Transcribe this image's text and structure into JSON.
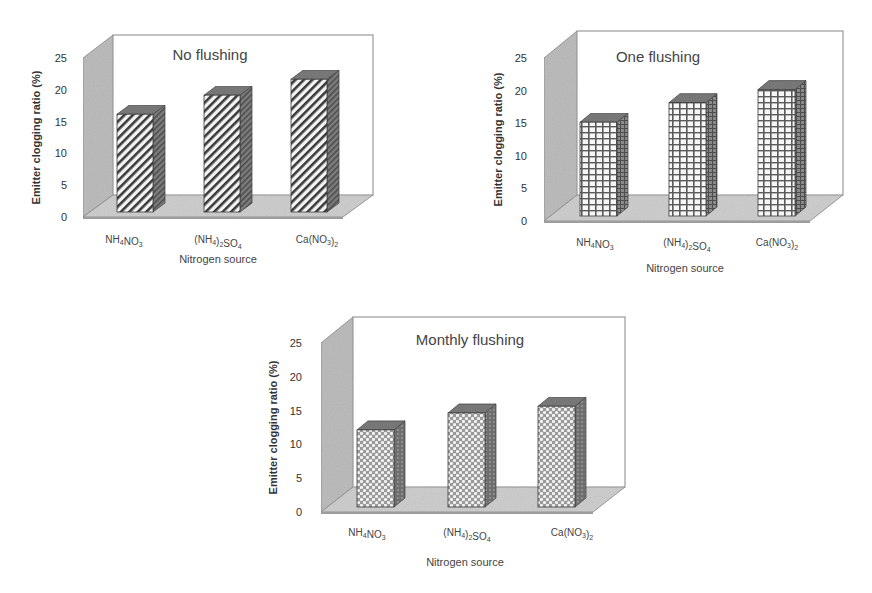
{
  "figure": {
    "charts": [
      {
        "title": "No flushing",
        "ylabel": "Emitter clogging ratio (%)",
        "xlabel": "Nitrogen source",
        "pattern": "diagonal",
        "yticks": [
          "0",
          "5",
          "10",
          "15",
          "20",
          "25"
        ],
        "categories": [
          {
            "base": "NH",
            "s1": "4",
            "mid": "NO",
            "s2": "3",
            "tail": ""
          },
          {
            "base": "(NH",
            "s1": "4",
            "mid": ")",
            "s2": "2",
            "tail": "SO",
            "s3": "4"
          },
          {
            "base": "Ca(NO",
            "s1": "3",
            "mid": ")",
            "s2": "2",
            "tail": ""
          }
        ]
      },
      {
        "title": "One flushing",
        "ylabel": "Emitter clogging ratio (%)",
        "xlabel": "Nitrogen source",
        "pattern": "grid",
        "yticks": [
          "0",
          "5",
          "10",
          "15",
          "20",
          "25"
        ],
        "categories": [
          {
            "base": "NH",
            "s1": "4",
            "mid": "NO",
            "s2": "3",
            "tail": ""
          },
          {
            "base": "(NH",
            "s1": "4",
            "mid": ")",
            "s2": "2",
            "tail": "SO",
            "s3": "4"
          },
          {
            "base": "Ca(NO",
            "s1": "3",
            "mid": ")",
            "s2": "2",
            "tail": ""
          }
        ]
      },
      {
        "title": "Monthly flushing",
        "ylabel": "Emitter clogging ratio (%)",
        "xlabel": "Nitrogen source",
        "pattern": "dots",
        "yticks": [
          "0",
          "5",
          "10",
          "15",
          "20",
          "25"
        ],
        "categories": [
          {
            "base": "NH",
            "s1": "4",
            "mid": "NO",
            "s2": "3",
            "tail": ""
          },
          {
            "base": "(NH",
            "s1": "4",
            "mid": ")",
            "s2": "2",
            "tail": "SO",
            "s3": "4"
          },
          {
            "base": "Ca(NO",
            "s1": "3",
            "mid": ")",
            "s2": "2",
            "tail": ""
          }
        ]
      }
    ]
  },
  "chart_data": [
    {
      "type": "bar",
      "title": "No flushing",
      "categories": [
        "NH4NO3",
        "(NH4)2SO4",
        "Ca(NO3)2"
      ],
      "values": [
        16,
        19,
        21.5
      ],
      "xlabel": "Nitrogen source",
      "ylabel": "Emitter clogging ratio (%)",
      "ylim": [
        0,
        25
      ],
      "yticks": [
        0,
        5,
        10,
        15,
        20,
        25
      ],
      "style": "3D bars, diagonal hatch"
    },
    {
      "type": "bar",
      "title": "One flushing",
      "categories": [
        "NH4NO3",
        "(NH4)2SO4",
        "Ca(NO3)2"
      ],
      "values": [
        15,
        18,
        20
      ],
      "xlabel": "Nitrogen source",
      "ylabel": "Emitter clogging ratio (%)",
      "ylim": [
        0,
        25
      ],
      "yticks": [
        0,
        5,
        10,
        15,
        20,
        25
      ],
      "style": "3D bars, grid hatch"
    },
    {
      "type": "bar",
      "title": "Monthly flushing",
      "categories": [
        "NH4NO3",
        "(NH4)2SO4",
        "Ca(NO3)2"
      ],
      "values": [
        12,
        14.5,
        15.5
      ],
      "xlabel": "Nitrogen source",
      "ylabel": "Emitter clogging ratio (%)",
      "ylim": [
        0,
        25
      ],
      "yticks": [
        0,
        5,
        10,
        15,
        20,
        25
      ],
      "style": "3D bars, dotted hatch"
    }
  ],
  "colors": {
    "wall": "#bdbdbd",
    "floor": "#cfcfcf",
    "bar_side": "#6e6e6e",
    "bar_top": "#7a7a7a",
    "hatch": "#3a3a3a"
  }
}
